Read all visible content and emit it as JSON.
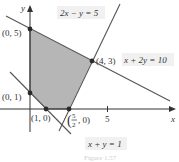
{
  "figure": {
    "caption": "Figure 1.57",
    "axes": {
      "x_label": "x",
      "y_label": "y",
      "x_tick": "5"
    },
    "vertices": [
      {
        "label": "(0, 5)",
        "x": 0,
        "y": 5
      },
      {
        "label": "(4, 3)",
        "x": 4,
        "y": 3
      },
      {
        "label": "(5/2, 0)",
        "x": 2.5,
        "y": 0
      },
      {
        "label": "(1, 0)",
        "x": 1,
        "y": 0
      },
      {
        "label": "(0, 1)",
        "x": 0,
        "y": 1
      }
    ],
    "lines": [
      {
        "equation": "2x − y = 5"
      },
      {
        "equation": "x + 2y = 10"
      },
      {
        "equation": "x + y = 1"
      }
    ],
    "colors": {
      "region_fill": "#a9a9a9",
      "line": "#555555",
      "axis": "#333333",
      "point": "#2a2a2a"
    }
  }
}
